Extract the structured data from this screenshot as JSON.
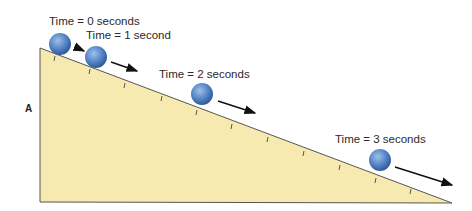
{
  "diagram": {
    "side_label": "A",
    "ramp_color": "#f7eab0",
    "ball_color": "#4f7fc0",
    "times": [
      {
        "label": "Time = 0 seconds"
      },
      {
        "label": "Time = 1 second"
      },
      {
        "label": "Time = 2 seconds"
      },
      {
        "label": "Time = 3 seconds"
      }
    ]
  }
}
